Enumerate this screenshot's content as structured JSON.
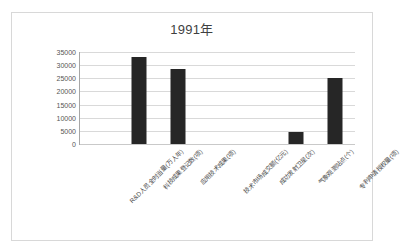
{
  "chart_data": {
    "type": "bar",
    "title": "1991年",
    "xlabel": "",
    "ylabel": "",
    "ylim": [
      0,
      35000
    ],
    "ytick_step": 5000,
    "yticks": [
      "35000",
      "30000",
      "25000",
      "20000",
      "15000",
      "10000",
      "5000",
      "0"
    ],
    "ytick_values": [
      35000,
      30000,
      25000,
      20000,
      15000,
      10000,
      5000,
      0
    ],
    "grid": true,
    "legend": false,
    "legend_position": "none",
    "categories": [
      "R&D人员全时当量(万人年)",
      "科技成果登记数(项)",
      "应用技术成果(项)",
      "技术市场成交额(亿元)",
      "成功发射卫星(次)",
      "气象观测站点(个)",
      "专利申请授权量(项)"
    ],
    "values": [
      0,
      33000,
      28500,
      0,
      0,
      4500,
      25000
    ],
    "bar_color": "#262626",
    "plot_background": "#ffffff",
    "grid_color": "#d9d9d9",
    "axis_color": "#a6a6a6"
  }
}
